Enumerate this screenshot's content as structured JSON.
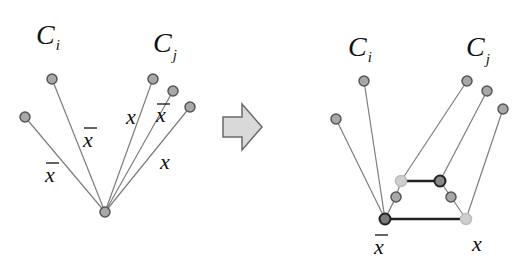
{
  "left_panel": {
    "labels": {
      "ci": {
        "main": "C",
        "sub": "i"
      },
      "cj": {
        "main": "C",
        "sub": "j"
      }
    },
    "center": {
      "x": 105,
      "y": 212
    },
    "nodes": [
      {
        "id": "ci-1",
        "x": 25,
        "y": 117
      },
      {
        "id": "ci-2",
        "x": 52,
        "y": 79
      },
      {
        "id": "cj-1",
        "x": 153,
        "y": 79
      },
      {
        "id": "cj-2",
        "x": 173,
        "y": 91
      },
      {
        "id": "cj-3",
        "x": 190,
        "y": 107
      }
    ],
    "edge_labels": [
      {
        "text": "x",
        "bar": true,
        "x": 53,
        "y": 182
      },
      {
        "text": "x",
        "bar": true,
        "x": 90,
        "y": 147
      },
      {
        "text": "x",
        "bar": false,
        "x": 133,
        "y": 124
      },
      {
        "text": "x",
        "bar": true,
        "x": 162,
        "y": 124
      },
      {
        "text": "x",
        "bar": false,
        "x": 167,
        "y": 168
      }
    ]
  },
  "arrow": {
    "direction": "right",
    "fill": "#d9d9d9",
    "stroke": "#6b6b6b"
  },
  "right_panel": {
    "labels": {
      "ci": {
        "main": "C",
        "sub": "i"
      },
      "cj": {
        "main": "C",
        "sub": "j"
      }
    },
    "nodes": [
      {
        "id": "ci-1",
        "x": 336,
        "y": 119
      },
      {
        "id": "ci-2",
        "x": 364,
        "y": 81
      },
      {
        "id": "cj-1",
        "x": 467,
        "y": 81
      },
      {
        "id": "cj-2",
        "x": 487,
        "y": 91
      },
      {
        "id": "cj-3",
        "x": 503,
        "y": 109
      },
      {
        "id": "xbar",
        "x": 385,
        "y": 219,
        "style": "dark"
      },
      {
        "id": "x",
        "x": 466,
        "y": 219,
        "style": "light"
      },
      {
        "id": "mid-left-upper",
        "x": 401,
        "y": 181,
        "style": "light"
      },
      {
        "id": "mid-right-upper",
        "x": 440,
        "y": 181,
        "style": "dark"
      },
      {
        "id": "mid-left-lower",
        "x": 396,
        "y": 197,
        "style": "normal"
      },
      {
        "id": "mid-right-lower",
        "x": 451,
        "y": 197,
        "style": "normal"
      }
    ],
    "bottom_labels": [
      {
        "text": "x",
        "bar": true,
        "x": 382,
        "y": 252
      },
      {
        "text": "x",
        "bar": false,
        "x": 478,
        "y": 250
      }
    ]
  },
  "colors": {
    "node_fill": "#a8a8a8",
    "node_stroke": "#555555",
    "node_light_fill": "#c8c8c8",
    "node_dark_fill": "#7a7a7a",
    "thin_line": "#7d7d7d",
    "thick_line": "#222222"
  }
}
